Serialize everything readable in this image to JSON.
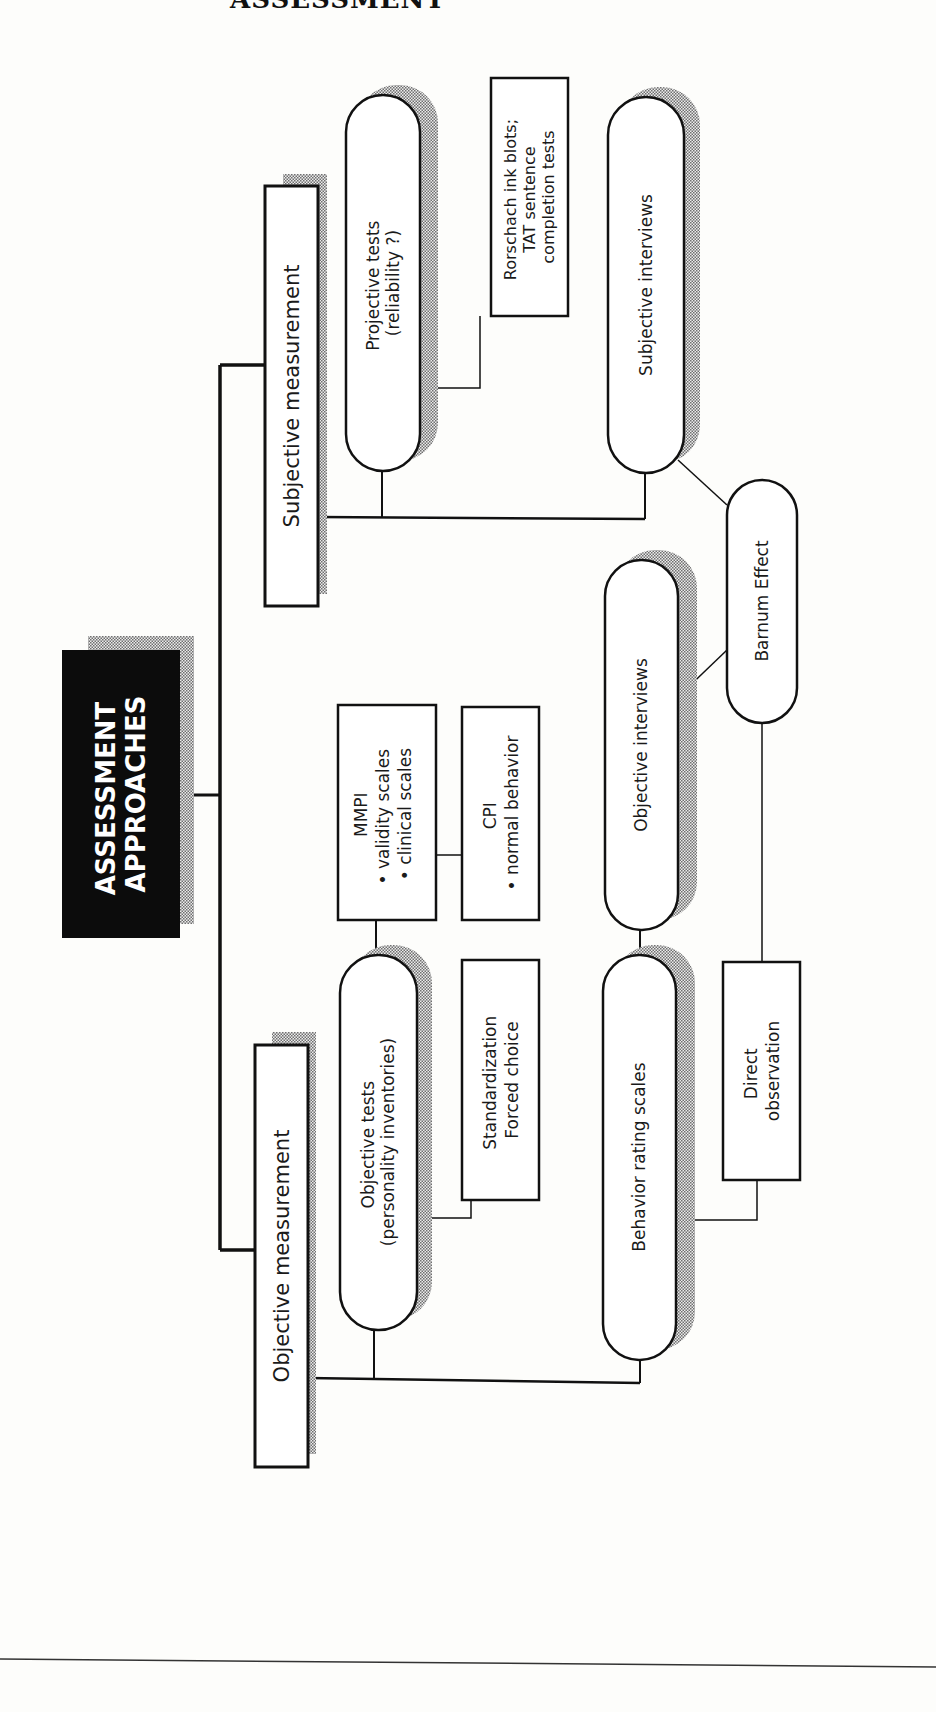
{
  "page": {
    "header_fragment": "ASSESSMENT",
    "footer_rule": true
  },
  "colors": {
    "ink": "#111111",
    "paper": "#fdfdfb",
    "shadow": "#9a9a9a",
    "title_fill": "#0c0c0c",
    "title_text": "#ffffff"
  },
  "diagram": {
    "title": {
      "lines": [
        "ASSESSMENT",
        "APPROACHES"
      ]
    },
    "branches": {
      "subjective": {
        "label": "Subjective measurement"
      },
      "objective": {
        "label": "Objective measurement"
      }
    },
    "nodes": {
      "projective_tests": {
        "lines": [
          "Projective tests",
          "(reliability ?)"
        ]
      },
      "rorschach": {
        "lines": [
          "Rorschach ink blots;",
          "TAT sentence",
          "completion tests"
        ]
      },
      "subjective_interviews": {
        "lines": [
          "Subjective interviews"
        ]
      },
      "barnum_effect": {
        "lines": [
          "Barnum Effect"
        ]
      },
      "objective_interviews": {
        "lines": [
          "Objective interviews"
        ]
      },
      "mmpi": {
        "lines": [
          "MMPI",
          "• validity scales",
          "• clinical scales"
        ]
      },
      "cpi": {
        "lines": [
          "CPI",
          "• normal behavior"
        ]
      },
      "objective_tests": {
        "lines": [
          "Objective tests",
          "(personality inventories)"
        ]
      },
      "standardization": {
        "lines": [
          "Standardization",
          "Forced choice"
        ]
      },
      "behavior_rating_scales": {
        "lines": [
          "Behavior rating scales"
        ]
      },
      "direct_observation": {
        "lines": [
          "Direct",
          "observation"
        ]
      }
    }
  }
}
